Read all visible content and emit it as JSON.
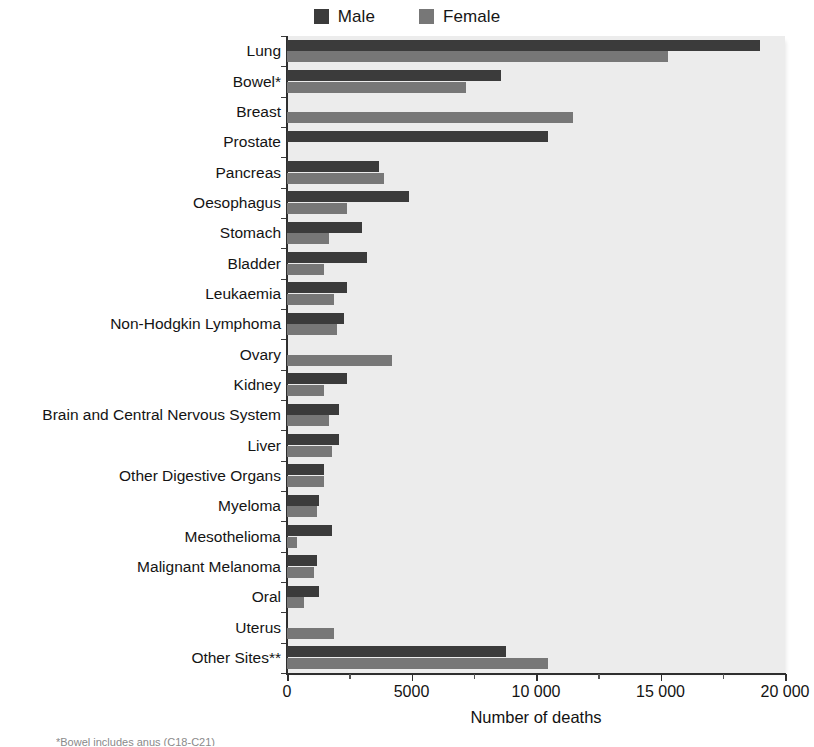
{
  "legend": {
    "position": "top-center",
    "items": [
      {
        "label": "Male",
        "color": "#3b3b3b",
        "swatch_name": "male-swatch"
      },
      {
        "label": "Female",
        "color": "#777777",
        "swatch_name": "female-swatch"
      }
    ]
  },
  "axis": {
    "x_title": "Number of deaths",
    "x_ticks": [
      "0",
      "5000",
      "10 000",
      "15 000",
      "20 000"
    ],
    "x_tick_values": [
      0,
      5000,
      10000,
      15000,
      20000
    ],
    "x_min": 0,
    "x_max": 20000
  },
  "footnote": "*Bowel includes anus (C18-C21)",
  "colors": {
    "male": "#3b3b3b",
    "female": "#777777",
    "plot_background": "#ececec",
    "axis": "#2e2e2e",
    "text": "#141414"
  },
  "chart_data": {
    "type": "bar",
    "orientation": "horizontal",
    "title": "",
    "subtitle": "",
    "xlabel": "Number of deaths",
    "ylabel": "",
    "xlim": [
      0,
      20000
    ],
    "grid": false,
    "legend_position": "top-center",
    "categories": [
      "Lung",
      "Bowel*",
      "Breast",
      "Prostate",
      "Pancreas",
      "Oesophagus",
      "Stomach",
      "Bladder",
      "Leukaemia",
      "Non-Hodgkin Lymphoma",
      "Ovary",
      "Kidney",
      "Brain and Central Nervous System",
      "Liver",
      "Other Digestive Organs",
      "Myeloma",
      "Mesothelioma",
      "Malignant Melanoma",
      "Oral",
      "Uterus",
      "Other Sites**"
    ],
    "series": [
      {
        "name": "Male",
        "color": "#3b3b3b",
        "values": [
          19000,
          8600,
          0,
          10500,
          3700,
          4900,
          3000,
          3200,
          2400,
          2300,
          0,
          2400,
          2100,
          2100,
          1500,
          1300,
          1800,
          1200,
          1300,
          0,
          8800
        ]
      },
      {
        "name": "Female",
        "color": "#777777",
        "values": [
          15300,
          7200,
          11500,
          0,
          3900,
          2400,
          1700,
          1500,
          1900,
          2000,
          4200,
          1500,
          1700,
          1800,
          1500,
          1200,
          400,
          1100,
          700,
          1900,
          10500
        ]
      }
    ]
  }
}
